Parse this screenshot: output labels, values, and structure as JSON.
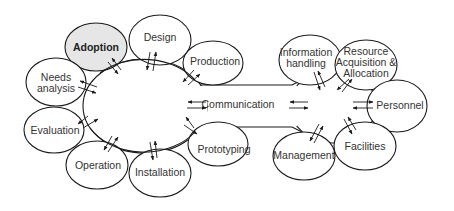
{
  "diagram": {
    "center_label": "Communication",
    "left_cluster": {
      "nodes": [
        {
          "id": "adoption",
          "label": "Adoption",
          "highlighted": true
        },
        {
          "id": "design",
          "label": "Design"
        },
        {
          "id": "production",
          "label": "Production"
        },
        {
          "id": "needs-analysis",
          "label_lines": [
            "Needs",
            "analysis"
          ]
        },
        {
          "id": "evaluation",
          "label": "Evaluation"
        },
        {
          "id": "operation",
          "label": "Operation"
        },
        {
          "id": "installation",
          "label": "Installation"
        },
        {
          "id": "prototyping",
          "label": "Prototyping"
        }
      ]
    },
    "right_cluster": {
      "nodes": [
        {
          "id": "information-handling",
          "label_lines": [
            "Information",
            "handling"
          ]
        },
        {
          "id": "resource-acquisition",
          "label_lines": [
            "Resource",
            "Acquisition &",
            "Allocation"
          ]
        },
        {
          "id": "personnel",
          "label": "Personnel"
        },
        {
          "id": "management",
          "label": "Management"
        },
        {
          "id": "facilities",
          "label": "Facilities"
        }
      ]
    },
    "colors": {
      "stroke": "#1a1a1a",
      "highlight_fill": "#e6e6e6",
      "background": "#ffffff",
      "text": "#333333"
    }
  }
}
